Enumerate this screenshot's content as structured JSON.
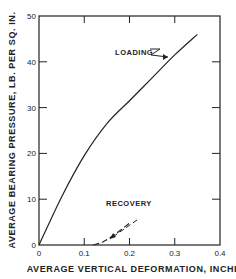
{
  "chart_data": {
    "type": "line",
    "title": "",
    "xlabel": "AVERAGE VERTICAL DEFORMATION, INCHES",
    "ylabel": "AVERAGE BEARING PRESSURE, LB. PER SQ. IN.",
    "xlim": [
      0,
      0.4
    ],
    "ylim": [
      0,
      50
    ],
    "xticks": [
      "0",
      "0.1",
      "0.2",
      "0.3",
      "0.4"
    ],
    "yticks": [
      "0",
      "10",
      "20",
      "30",
      "40",
      "50"
    ],
    "grid": false,
    "series": [
      {
        "name": "LOADING",
        "style": "solid",
        "x": [
          0,
          0.05,
          0.1,
          0.15,
          0.2,
          0.25,
          0.3,
          0.35
        ],
        "y": [
          0,
          10.5,
          19.5,
          26.5,
          31.5,
          36.5,
          41.5,
          46
        ]
      },
      {
        "name": "RECOVERY",
        "style": "dashed",
        "x": [
          0.12,
          0.14,
          0.16,
          0.18,
          0.2
        ],
        "y": [
          0,
          0.6,
          1.8,
          3.2,
          4.8
        ]
      }
    ],
    "annotations": [
      {
        "text": "LOADING",
        "x": 0.23,
        "y": 40.5
      },
      {
        "text": "RECOVERY",
        "x": 0.21,
        "y": 7.5
      }
    ]
  }
}
